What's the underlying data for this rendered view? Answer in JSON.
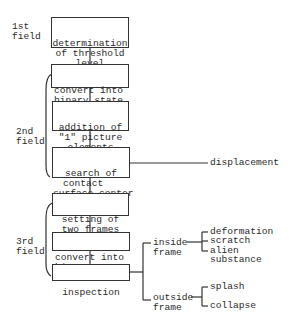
{
  "fields": [
    {
      "label_line1": "1st",
      "label_line2": "field"
    },
    {
      "label_line1": "2nd",
      "label_line2": "field"
    },
    {
      "label_line1": "3rd",
      "label_line2": "field"
    }
  ],
  "steps": [
    {
      "lines": [
        "determination",
        "of threshold",
        "level"
      ]
    },
    {
      "lines": [
        "convert into",
        "binary state"
      ]
    },
    {
      "lines": [
        "addition of",
        "\"1\" picture",
        "elements"
      ]
    },
    {
      "lines": [
        "search of",
        "contact",
        "surface center"
      ]
    },
    {
      "lines": [
        "setting of",
        "two frames"
      ]
    },
    {
      "lines": [
        "convert into",
        "binary state"
      ]
    },
    {
      "lines": [
        "inspection"
      ]
    }
  ],
  "outputs": {
    "displacement": "displacement",
    "inside_frame": {
      "line1": "inside",
      "line2": "frame",
      "items": [
        "deformation",
        "scratch",
        "alien",
        "substance"
      ]
    },
    "outside_frame": {
      "line1": "outside",
      "line2": "frame",
      "items": [
        "splash",
        "collapse"
      ]
    }
  }
}
